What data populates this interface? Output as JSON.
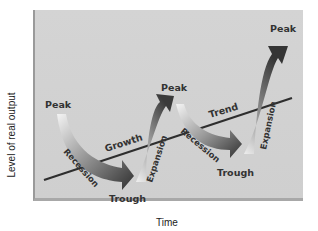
{
  "diagram": {
    "title": "",
    "axes": {
      "y_label": "Level of real output",
      "x_label": "Time"
    },
    "trend_line": {
      "label": "Trend",
      "color": "#2e2e2e"
    },
    "labels": {
      "peak1": "Peak",
      "peak2": "Peak",
      "peak3": "Peak",
      "trough1": "Trough",
      "trough2": "Trough",
      "recession1": "Recession",
      "recession2": "Recession",
      "expansion1": "Expansion",
      "expansion2": "Expansion",
      "growth": "Growth",
      "trend": "Trend"
    },
    "colors": {
      "background": "#d2d2d2",
      "arrow_light": "#f2f2f2",
      "arrow_dark": "#3a3a3a",
      "text": "#333333"
    }
  }
}
